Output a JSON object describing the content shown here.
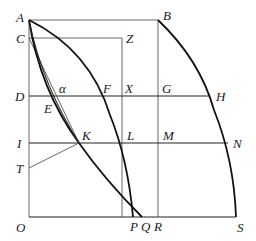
{
  "figure": {
    "type": "geometric-diagram",
    "labels": {
      "A": "A",
      "B": "B",
      "C": "C",
      "Z": "Z",
      "D": "D",
      "E": "E",
      "alpha": "α",
      "F": "F",
      "X": "X",
      "G": "G",
      "H": "H",
      "I": "I",
      "K": "K",
      "L": "L",
      "M": "M",
      "N": "N",
      "T": "T",
      "O": "O",
      "P": "P",
      "Q": "Q",
      "R": "R",
      "S": "S"
    },
    "points": {
      "A": [
        29,
        20
      ],
      "B": [
        158,
        20
      ],
      "C": [
        29,
        38
      ],
      "Z": [
        122,
        38
      ],
      "D": [
        29,
        96
      ],
      "F": [
        98,
        96
      ],
      "X": [
        122,
        96
      ],
      "G": [
        158,
        96
      ],
      "H": [
        210,
        96
      ],
      "I": [
        29,
        143
      ],
      "K": [
        79,
        143
      ],
      "L": [
        122,
        143
      ],
      "M": [
        158,
        143
      ],
      "N": [
        228,
        143
      ],
      "T": [
        29,
        168
      ],
      "O": [
        29,
        217
      ],
      "P": [
        133,
        217
      ],
      "Q": [
        142,
        217
      ],
      "R": [
        158,
        217
      ],
      "S": [
        236,
        217
      ]
    },
    "colors": {
      "line": "#222222",
      "curve": "#111111",
      "background": "#ffffff"
    }
  }
}
